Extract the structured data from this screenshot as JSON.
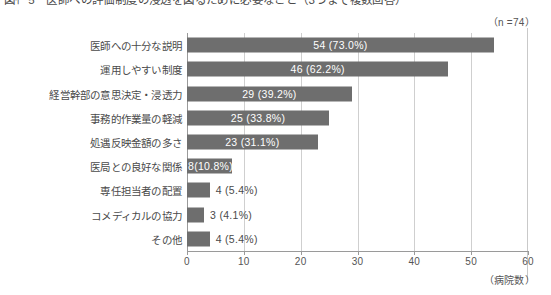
{
  "figure": {
    "title": "図ｲｰ5　医師への評価制度の浸透を図るために必要なこと（3つまで複数回答）",
    "sample_size_label": "（n =74）",
    "unit_caption": "（病院数）"
  },
  "chart_data": {
    "type": "bar",
    "orientation": "horizontal",
    "title": "図ｲｰ5　医師への評価制度の浸透を図るために必要なこと（3つまで複数回答）",
    "xlabel": "（病院数）",
    "ylabel": "",
    "xlim": [
      0,
      60
    ],
    "xticks": [
      0,
      10,
      20,
      30,
      40,
      50,
      60
    ],
    "xtick_labels": [
      "0",
      "10",
      "20",
      "30",
      "40",
      "50",
      "60"
    ],
    "grid": true,
    "legend": false,
    "n": 74,
    "annotation": "（n =74）",
    "bar_color": "#6e6e6e",
    "categories": [
      "医師への十分な説明",
      "運用しやすい制度",
      "経営幹部の意思決定・浸透力",
      "事務的作業量の軽減",
      "処遇反映金額の多さ",
      "医局との良好な関係",
      "専任担当者の配置",
      "コメディカルの協力",
      "その他"
    ],
    "values": [
      54,
      46,
      29,
      25,
      23,
      8,
      4,
      3,
      4
    ],
    "percents": [
      "73.0%",
      "62.2%",
      "39.2%",
      "33.8%",
      "31.1%",
      "10.8%",
      "5.4%",
      "4.1%",
      "5.4%"
    ],
    "data_labels": [
      "54 (73.0%)",
      "46 (62.2%)",
      "29 (39.2%)",
      "25 (33.8%)",
      "23 (31.1%)",
      "8(10.8%)",
      "4 (5.4%)",
      "3 (4.1%)",
      "4 (5.4%)"
    ],
    "label_inside": [
      true,
      true,
      true,
      true,
      true,
      true,
      false,
      false,
      false
    ]
  }
}
